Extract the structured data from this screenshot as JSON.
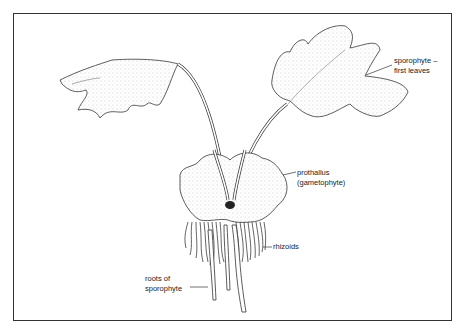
{
  "figure": {
    "labels": {
      "sporophyte_leaves": [
        "sporophyte –",
        "first leaves"
      ],
      "prothallus": [
        "prothallus",
        "(gametophyte)"
      ],
      "rhizoids": "rhizoids",
      "roots": [
        "roots of",
        "sporophyte"
      ]
    }
  }
}
